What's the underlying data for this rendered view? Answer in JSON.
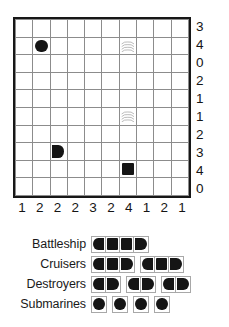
{
  "puzzle": {
    "type": "battleships-solitaire",
    "grid": {
      "rows": 10,
      "cols": 10
    },
    "row_clues": [
      3,
      4,
      0,
      2,
      1,
      1,
      2,
      3,
      4,
      0
    ],
    "col_clues": [
      1,
      2,
      2,
      2,
      3,
      2,
      4,
      1,
      2,
      1
    ],
    "given_marks": [
      {
        "row": 2,
        "col": 2,
        "kind": "sub",
        "icon": "filled-circle-icon"
      },
      {
        "row": 2,
        "col": 7,
        "kind": "water",
        "icon": "water-waves-icon"
      },
      {
        "row": 6,
        "col": 7,
        "kind": "water",
        "icon": "water-waves-icon"
      },
      {
        "row": 8,
        "col": 3,
        "kind": "end-right",
        "icon": "ship-end-right-icon"
      },
      {
        "row": 9,
        "col": 7,
        "kind": "square",
        "icon": "ship-middle-square-icon"
      }
    ]
  },
  "fleet": {
    "rows": [
      {
        "label": "Battleship",
        "ships": [
          4
        ]
      },
      {
        "label": "Cruisers",
        "ships": [
          3,
          3
        ]
      },
      {
        "label": "Destroyers",
        "ships": [
          2,
          2,
          2
        ]
      },
      {
        "label": "Submarines",
        "ships": [
          1,
          1,
          1,
          1
        ]
      }
    ]
  },
  "colors": {
    "ink": "#151515",
    "grid_line": "#8c8c8c",
    "border": "#171717",
    "legend_line": "#a8a8a8",
    "paper": "#ffffff"
  }
}
